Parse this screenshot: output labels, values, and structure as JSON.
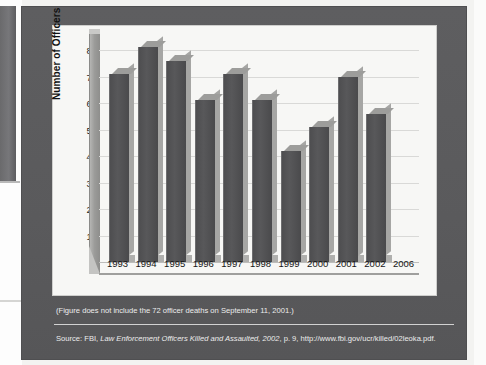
{
  "figure": {
    "y_axis_title": "Number of Officers",
    "footnote": "(Figure does not include the 72 officer deaths on September 11, 2001.)",
    "source": {
      "prefix": "Source: FBI, ",
      "title_italic": "Law Enforcement Officers Killed and Assaulted, 2002",
      "suffix": ", p. 9, http://www.fbi.gov/ucr/killed/02leoka.pdf."
    },
    "colors": {
      "frame": "#5b5b5d",
      "panel": "#f7f7f5",
      "bar_face": "#4e4e50",
      "bar_side": "#a6a6a4",
      "gridline": "#d9d9d7",
      "text_on_frame": "#ececec"
    }
  },
  "chart_data": {
    "type": "bar",
    "title": "",
    "xlabel": "",
    "ylabel": "Number of Officers",
    "categories": [
      "1993",
      "1994",
      "1995",
      "1996",
      "1997",
      "1998",
      "1999",
      "2000",
      "2001",
      "2002",
      "2006"
    ],
    "values": [
      71,
      81,
      76,
      61,
      71,
      61,
      42,
      51,
      70,
      56,
      null
    ],
    "ylim": [
      0,
      80
    ],
    "yticks": [
      0,
      10,
      20,
      30,
      40,
      50,
      60,
      70,
      80
    ],
    "ytick_labels": [
      "0",
      "10",
      "20",
      "30",
      "40",
      "50",
      "60",
      "70",
      "80"
    ],
    "grid": true,
    "legend": false,
    "style_3d": true
  }
}
